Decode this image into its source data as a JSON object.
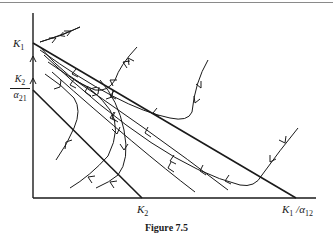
{
  "figure": {
    "caption": "Figure 7.5",
    "labels": {
      "k1_y_main": "K",
      "k1_y_sub": "1",
      "k2_alpha_num_main": "K",
      "k2_alpha_num_sub": "2",
      "k2_alpha_den_main": "α",
      "k2_alpha_den_sub": "21",
      "k2_x_main": "K",
      "k2_x_sub": "2",
      "k1_alpha_x_main": "K",
      "k1_alpha_x_sub1": "1",
      "k1_alpha_x_slash": " /α",
      "k1_alpha_x_sub2": "12"
    },
    "colors": {
      "ink": "#1a1a1a",
      "border": "#8a8a8a"
    }
  }
}
